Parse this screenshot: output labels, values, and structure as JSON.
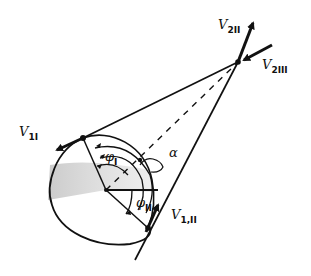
{
  "diagram": {
    "type": "hand-drawn orbital transfer / gravity-assist geometry sketch",
    "colors": {
      "ink": "#111111",
      "shade": "#bdbdbd",
      "background": "#ffffff"
    },
    "labels": {
      "v2_II": {
        "main": "V",
        "sub": "2II"
      },
      "v2_III": {
        "main": "V",
        "sub": "2III"
      },
      "v1_I": {
        "main": "V",
        "sub": "1I"
      },
      "v1_II": {
        "main": "V",
        "sub": "1,II"
      },
      "phi_I": {
        "main": "φ",
        "sub": "I"
      },
      "phi_II": {
        "main": "φ",
        "sub": "II"
      },
      "alpha": {
        "main": "α"
      }
    },
    "nodes": [
      {
        "id": "apex",
        "label": "intersection of tangents"
      },
      {
        "id": "tangent_point_upper",
        "label": "upper tangency point"
      },
      {
        "id": "tangent_point_lower",
        "label": "lower tangency point"
      },
      {
        "id": "center",
        "label": "circle center"
      }
    ],
    "edges": [
      {
        "from": "tangent_point_upper",
        "to": "apex",
        "style": "solid"
      },
      {
        "from": "tangent_point_lower",
        "to": "apex",
        "style": "solid"
      },
      {
        "from": "center",
        "to": "apex",
        "style": "dashed"
      },
      {
        "from": "center",
        "to": "tangent_point_upper",
        "style": "solid"
      },
      {
        "from": "center",
        "to": "tangent_point_lower",
        "style": "solid"
      }
    ]
  }
}
